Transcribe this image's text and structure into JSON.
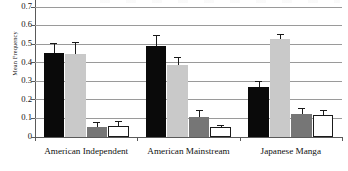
{
  "chart_data": {
    "type": "bar",
    "title": "",
    "xlabel": "",
    "ylabel": "Mean Frequency",
    "ylim": [
      0,
      0.7
    ],
    "ytick_labels": [
      "0.7",
      "0.6",
      "0.5",
      "0.4",
      "0.3",
      "0.2",
      "0.1",
      "0"
    ],
    "ytick_values": [
      0.7,
      0.6,
      0.5,
      0.4,
      0.3,
      0.2,
      0.1,
      0
    ],
    "grid": true,
    "legend_position": "none",
    "categories": [
      "American Independent",
      "American Mainstream",
      "Japanese Manga"
    ],
    "series": [
      {
        "name": "series-1",
        "color": "#0a0a0a",
        "style": "black-fill",
        "values": [
          0.45,
          0.485,
          0.265
        ],
        "errors": [
          0.055,
          0.06,
          0.035
        ]
      },
      {
        "name": "series-2",
        "color": "#c9c9c9",
        "style": "light-gray-fill",
        "values": [
          0.445,
          0.385,
          0.525
        ],
        "errors": [
          0.065,
          0.045,
          0.025
        ]
      },
      {
        "name": "series-3",
        "color": "#767676",
        "style": "dark-gray-fill",
        "values": [
          0.05,
          0.105,
          0.12
        ],
        "errors": [
          0.028,
          0.04,
          0.035
        ]
      },
      {
        "name": "series-4",
        "color": "#ffffff",
        "style": "white-fill-outlined",
        "values": [
          0.055,
          0.05,
          0.115
        ],
        "errors": [
          0.03,
          0.012,
          0.03
        ]
      }
    ]
  },
  "axis": {
    "y_title": "Mean Frequency"
  }
}
